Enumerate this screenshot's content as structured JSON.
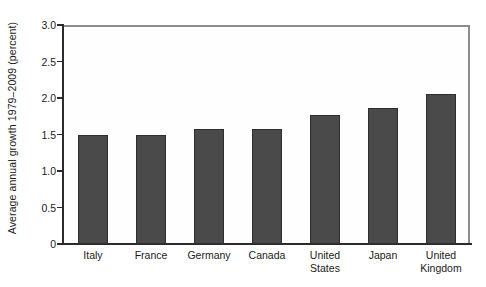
{
  "chart_data": {
    "type": "bar",
    "title": "",
    "xlabel": "",
    "ylabel": "Average annual growth 1979–2009 (percent)",
    "categories": [
      "Italy",
      "France",
      "Germany",
      "Canada",
      "United States",
      "Japan",
      "United Kingdom"
    ],
    "category_lines": [
      [
        "Italy"
      ],
      [
        "France"
      ],
      [
        "Germany"
      ],
      [
        "Canada"
      ],
      [
        "United",
        "States"
      ],
      [
        "Japan"
      ],
      [
        "United",
        "Kingdom"
      ]
    ],
    "values": [
      1.5,
      1.49,
      1.58,
      1.57,
      1.77,
      1.86,
      2.05
    ],
    "ylim": [
      0,
      3.0
    ],
    "yticks": [
      0,
      0.5,
      1.0,
      1.5,
      2.0,
      2.5,
      3.0
    ],
    "ytick_labels": [
      "0",
      "0.5",
      "1.0",
      "1.5",
      "2.0",
      "2.5",
      "3.0"
    ],
    "grid": false,
    "legend": "none",
    "bar_color": "#4a4a4a",
    "bar_edge_color": "#2e2e2e",
    "axis_color": "#2b2b2b",
    "frame_color": "#8c8c8c",
    "plot_background": "#fefefe"
  }
}
